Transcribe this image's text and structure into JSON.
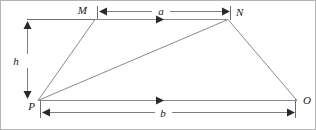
{
  "figure": {
    "kind": "geometry-diagram",
    "caption": "",
    "shape_name": "trapezoid MNOP",
    "background_color": "#ffffff",
    "line_color": "#8a8a8a",
    "text_color": "#1a1a1a",
    "width": 316,
    "height": 130
  },
  "vertices": [
    {
      "id": "M",
      "label": "M",
      "x": 95,
      "y": 19,
      "label_x": 87,
      "label_y": 14
    },
    {
      "id": "N",
      "label": "N",
      "x": 228,
      "y": 19,
      "label_x": 236,
      "label_y": 15
    },
    {
      "id": "O",
      "label": "O",
      "x": 297,
      "y": 100,
      "label_x": 303,
      "label_y": 99
    },
    {
      "id": "P",
      "label": "P",
      "x": 38,
      "y": 100,
      "label_x": 30,
      "label_y": 108
    }
  ],
  "edges": [
    {
      "name": "edge-MN",
      "from": "M",
      "to": "N",
      "has_mid_arrow": true
    },
    {
      "name": "edge-NO",
      "from": "N",
      "to": "O",
      "has_mid_arrow": false
    },
    {
      "name": "edge-PO",
      "from": "P",
      "to": "O",
      "has_mid_arrow": true
    },
    {
      "name": "edge-PM",
      "from": "P",
      "to": "M",
      "has_mid_arrow": false
    },
    {
      "name": "diagonal-PN",
      "from": "P",
      "to": "N",
      "has_mid_arrow": false
    }
  ],
  "dimensions": [
    {
      "name": "dimension-a",
      "label": "a",
      "orientation": "horizontal",
      "measures": "MN",
      "label_x": 160,
      "label_y": 9,
      "line_y": 11,
      "x_start": 98,
      "x_end": 230
    },
    {
      "name": "dimension-b",
      "label": "b",
      "orientation": "horizontal",
      "measures": "PO",
      "label_x": 163,
      "label_y": 120,
      "line_y": 112,
      "x_start": 41,
      "x_end": 294
    },
    {
      "name": "dimension-h",
      "label": "h",
      "orientation": "vertical",
      "measures": "height",
      "label_x": 14,
      "label_y": 62,
      "line_x": 27,
      "y_start": 21,
      "y_end": 98
    }
  ]
}
